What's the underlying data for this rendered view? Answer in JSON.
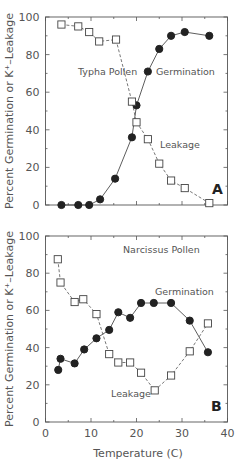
{
  "figure": {
    "ylabel": "Percent Germination or K⁺–Leakage",
    "xlabel": "Temperature (C)"
  },
  "chart_data": [
    {
      "type": "line",
      "panel": "A",
      "title": "Typha Pollen",
      "xlabel": "Temperature (C)",
      "ylabel": "Percent Germination or K⁺–Leakage",
      "xlim": [
        0,
        40
      ],
      "ylim": [
        0,
        100
      ],
      "xticks": [
        0,
        10,
        20,
        30,
        40
      ],
      "yticks": [
        0,
        20,
        40,
        60,
        80,
        100
      ],
      "grid": false,
      "annotations": [
        "Typha Pollen",
        "Germination",
        "Leakage",
        "A"
      ],
      "series": [
        {
          "name": "Germination",
          "marker": "filled-circle",
          "line": "solid",
          "x": [
            3.5,
            7.2,
            9.6,
            12.0,
            15.3,
            19.0,
            20.0,
            22.5,
            25.0,
            27.6,
            30.6,
            36.0
          ],
          "y": [
            0,
            0,
            0,
            3,
            14,
            36,
            53,
            71,
            83,
            90,
            92,
            90
          ]
        },
        {
          "name": "Leakage",
          "marker": "open-square",
          "line": "dashed",
          "x": [
            3.5,
            7.2,
            9.6,
            11.8,
            15.5,
            19.0,
            20.0,
            22.5,
            25.0,
            27.6,
            30.6,
            36.0
          ],
          "y": [
            96,
            95,
            92,
            87,
            88,
            55,
            44,
            35,
            22,
            13,
            9,
            1
          ]
        }
      ]
    },
    {
      "type": "line",
      "panel": "B",
      "title": "Narcissus Pollen",
      "xlabel": "Temperature (C)",
      "ylabel": "Percent Germination or K⁺–Leakage",
      "xlim": [
        0,
        40
      ],
      "ylim": [
        0,
        100
      ],
      "xticks": [
        0,
        10,
        20,
        30,
        40
      ],
      "yticks": [
        0,
        20,
        40,
        60,
        80,
        100
      ],
      "grid": false,
      "annotations": [
        "Narcissus Pollen",
        "Germination",
        "Leakage",
        "B"
      ],
      "series": [
        {
          "name": "Germination",
          "marker": "filled-circle",
          "line": "solid",
          "x": [
            2.8,
            3.3,
            6.4,
            8.5,
            11.2,
            14.0,
            16.0,
            18.6,
            21.0,
            23.8,
            27.6,
            31.7,
            35.7
          ],
          "y": [
            28,
            34,
            31.5,
            39,
            45,
            49.5,
            59,
            56,
            64,
            64,
            64,
            54.5,
            37.5
          ]
        },
        {
          "name": "Leakage",
          "marker": "open-square",
          "line": "dashed",
          "x": [
            2.7,
            3.3,
            6.4,
            8.3,
            11.2,
            14.0,
            16.0,
            18.6,
            21.0,
            24.0,
            27.6,
            31.7,
            35.7
          ],
          "y": [
            87.5,
            75,
            64.5,
            66,
            58,
            36.5,
            32,
            32,
            26.5,
            17,
            25,
            38,
            53
          ]
        }
      ]
    }
  ]
}
